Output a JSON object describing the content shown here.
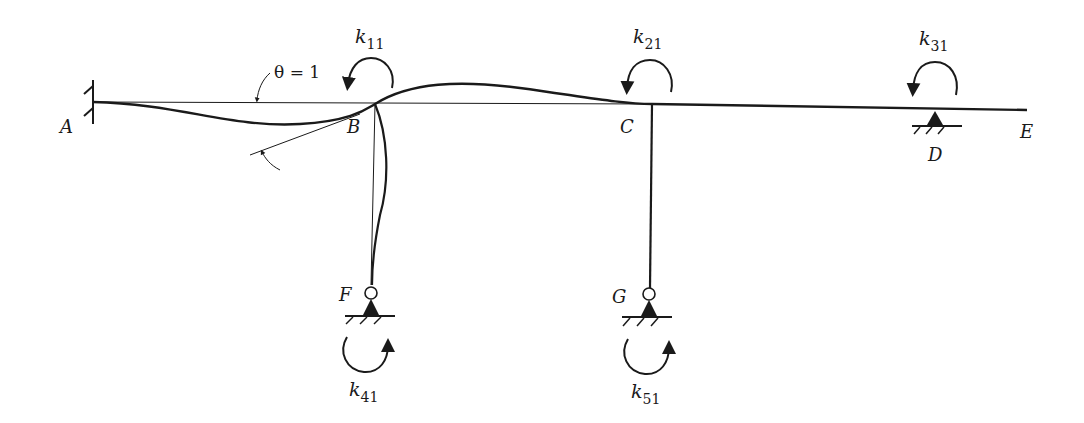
{
  "figure": {
    "type": "structural-frame-deflection-diagram"
  },
  "nodes": {
    "A": {
      "label": "A",
      "support": "fixed"
    },
    "B": {
      "label": "B",
      "support": "none"
    },
    "C": {
      "label": "C",
      "support": "none"
    },
    "D": {
      "label": "D",
      "support": "pin"
    },
    "E": {
      "label": "E",
      "support": "free-end"
    },
    "F": {
      "label": "F",
      "support": "pin-hinge"
    },
    "G": {
      "label": "G",
      "support": "pin-hinge"
    }
  },
  "annotations": {
    "rotation": "θ = 1"
  },
  "stiffness": [
    {
      "base": "k",
      "sub": "11",
      "node": "B",
      "direction": "counterclockwise"
    },
    {
      "base": "k",
      "sub": "21",
      "node": "C",
      "direction": "counterclockwise"
    },
    {
      "base": "k",
      "sub": "31",
      "node": "D",
      "direction": "counterclockwise"
    },
    {
      "base": "k",
      "sub": "41",
      "node": "F",
      "direction": "counterclockwise"
    },
    {
      "base": "k",
      "sub": "51",
      "node": "G",
      "direction": "counterclockwise"
    }
  ],
  "colors": {
    "line": "#1a1a1a",
    "background": "#ffffff"
  }
}
